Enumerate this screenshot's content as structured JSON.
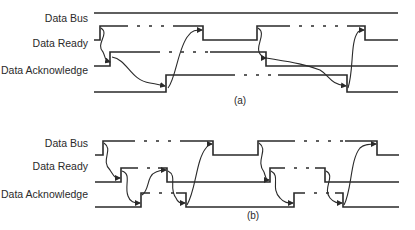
{
  "diagram": {
    "colors": {
      "line": "#2a2a2a",
      "background": "#ffffff"
    },
    "panels": [
      {
        "caption": "(a)",
        "caption_pos": [
          240,
          104
        ],
        "reference_line": {
          "x1": 94,
          "x2": 398,
          "y": 13
        },
        "signals": [
          {
            "name": "Data Bus",
            "label_pos": [
              88,
              22
            ],
            "low": 40,
            "high": 26,
            "x_start": 94,
            "x_end": 398,
            "edges": [
              100,
              203,
              257,
              365
            ],
            "dashed": [
              [
                128,
                175
              ],
              [
                290,
                350
              ]
            ]
          },
          {
            "name": "Data Ready",
            "label_pos": [
              88,
              47
            ],
            "low": 66,
            "high": 52,
            "x_start": 94,
            "x_end": 398,
            "edges": [
              110,
              266
            ],
            "dashed": [
              [
                160,
                210
              ]
            ]
          },
          {
            "name": "Data Acknowledge",
            "label_pos": [
              88,
              74
            ],
            "low": 92,
            "high": 75,
            "x_start": 94,
            "x_end": 398,
            "edges": [
              166,
              347
            ],
            "dashed": [
              [
                235,
                278
              ]
            ]
          }
        ],
        "arrows": [
          "M101,28 C110,34 95,44 103,52 C106,58 104,60 110,62",
          "M112,57 C128,60 130,80 150,83 C156,84 160,85 165,86",
          "M168,88 C176,78 178,48 188,36 C192,30 196,30 202,30",
          "M258,28 C268,34 252,48 262,56 C264,58 264,58 266,58",
          "M266,58 C290,62 305,64 320,70 C330,76 330,84 346,86",
          "M348,88 C354,70 350,42 358,32 C360,30 362,30 364,30"
        ]
      },
      {
        "caption": "(b)",
        "caption_pos": [
          253,
          219
        ],
        "signals": [
          {
            "name": "Data Bus",
            "label_pos": [
              88,
              147
            ],
            "low": 155,
            "high": 141,
            "x_start": 95,
            "x_end": 399,
            "edges": [
              103,
              213,
              258,
              377
            ],
            "dashed": [
              [
                135,
                182
              ],
              [
                295,
                345
              ]
            ]
          },
          {
            "name": "Data Ready",
            "label_pos": [
              88,
              170
            ],
            "low": 182,
            "high": 168,
            "x_start": 95,
            "x_end": 399,
            "edges": [
              121,
              167,
              270,
              325
            ],
            "dashed": [
              [
                138,
                158
              ],
              [
                285,
                315
              ]
            ]
          },
          {
            "name": "Data Acknowledge",
            "label_pos": [
              88,
              198
            ],
            "low": 207,
            "high": 193,
            "x_start": 95,
            "x_end": 399,
            "edges": [
              141,
              186,
              294,
              343
            ],
            "dashed": [
              [
                150,
                176
              ],
              [
                305,
                335
              ]
            ]
          }
        ],
        "arrows": [
          "M104,143 C114,150 100,160 110,170 C114,176 114,178 120,178",
          "M122,171 C132,174 124,186 128,196 C130,202 134,203 140,203",
          "M142,195 C150,190 146,176 156,172 C160,170 162,170 166,170",
          "M168,171 C178,176 168,188 176,198 C178,203 180,203 185,203",
          "M187,205 C196,190 196,160 206,148 C208,145 210,144 212,144",
          "M259,143 C269,150 255,160 264,172 C266,178 266,180 269,180",
          "M271,171 C281,176 270,188 280,198 C284,203 288,203 293,203",
          "M326,171 C336,176 322,188 330,198 C334,203 338,203 342,203",
          "M344,205 C352,190 350,160 360,148 C364,144 370,144 376,144"
        ]
      }
    ]
  }
}
